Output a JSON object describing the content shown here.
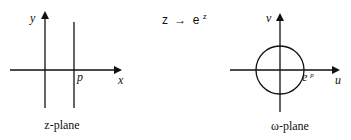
{
  "diagram": {
    "mapping": "z → eᶻ",
    "mapping_parts": {
      "lhs": "z",
      "arrow": "→",
      "base": "e",
      "exp": "z"
    },
    "left_plane": {
      "caption": "z-plane",
      "x_axis_label": "x",
      "y_axis_label": "y",
      "line_label": "p",
      "description": "vertical line x = p"
    },
    "right_plane": {
      "caption": "ω-plane",
      "u_axis_label": "u",
      "v_axis_label": "v",
      "circle_label_base": "e",
      "circle_label_exp": "p",
      "description": "circle of radius e^p centered at origin"
    },
    "stroke_color": "#111111"
  }
}
